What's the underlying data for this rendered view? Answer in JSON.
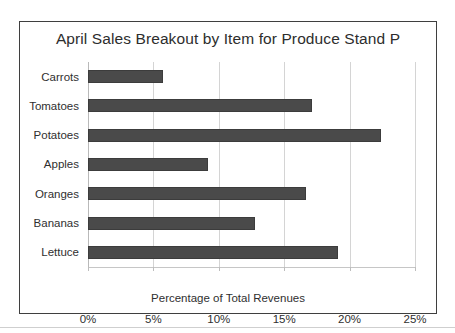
{
  "chart_data": {
    "type": "bar",
    "orientation": "horizontal",
    "title": "April Sales Breakout by Item for Produce Stand P",
    "xlabel": "Percentage of Total Revenues",
    "ylabel": "",
    "categories": [
      "Carrots",
      "Tomatoes",
      "Potatoes",
      "Apples",
      "Oranges",
      "Bananas",
      "Lettuce"
    ],
    "values": [
      5.7,
      17.1,
      22.4,
      9.2,
      16.7,
      12.8,
      19.1
    ],
    "xlim": [
      0,
      25
    ],
    "ylim": null,
    "xtick_labels": [
      "0%",
      "5%",
      "10%",
      "15%",
      "20%",
      "25%"
    ],
    "xtick_values": [
      0,
      5,
      10,
      15,
      20,
      25
    ],
    "grid": "vertical",
    "legend": "none",
    "bar_color": "#4a4a4a",
    "gridline_color": "#d4d4d4",
    "frame_color": "#3f3f3f",
    "text_color": "#2f2f2f"
  }
}
